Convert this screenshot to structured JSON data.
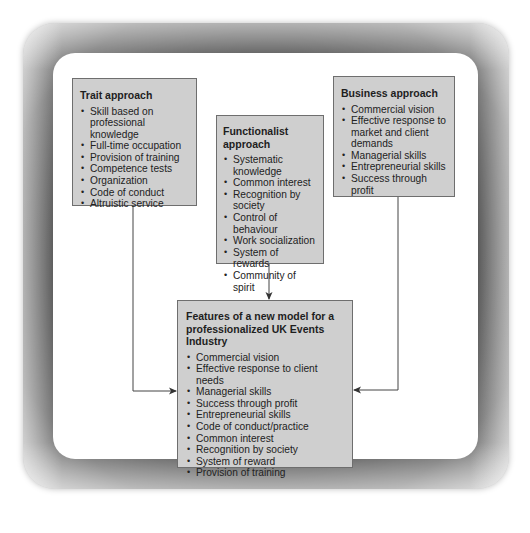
{
  "diagram": {
    "trait": {
      "title": "Trait approach",
      "items": [
        "Skill based on professional knowledge",
        "Full-time occupation",
        "Provision of training",
        "Competence tests",
        "Organization",
        "Code of conduct",
        "Altruistic service"
      ]
    },
    "functionalist": {
      "title": "Functionalist approach",
      "items": [
        "Systematic knowledge",
        "Common interest",
        "Recognition by society",
        "Control of behaviour",
        "Work socialization",
        "System of rewards",
        "Community of spirit"
      ]
    },
    "business": {
      "title": "Business approach",
      "items": [
        "Commercial vision",
        "Effective response to market and client demands",
        "Managerial skills",
        "Entrepreneurial skills",
        "Success through profit"
      ]
    },
    "model": {
      "title": "Features of a new model for a professionalized UK Events Industry",
      "items": [
        "Commercial vision",
        "Effective response to client needs",
        "Managerial skills",
        "Success through profit",
        "Entrepreneurial skills",
        "Code of conduct/practice",
        "Common interest",
        "Recognition by society",
        "System of reward",
        "Provision of training"
      ]
    },
    "edges": [
      {
        "from": "Trait approach",
        "to": "Features of a new model"
      },
      {
        "from": "Functionalist approach",
        "to": "Features of a new model"
      },
      {
        "from": "Business approach",
        "to": "Features of a new model"
      }
    ]
  }
}
